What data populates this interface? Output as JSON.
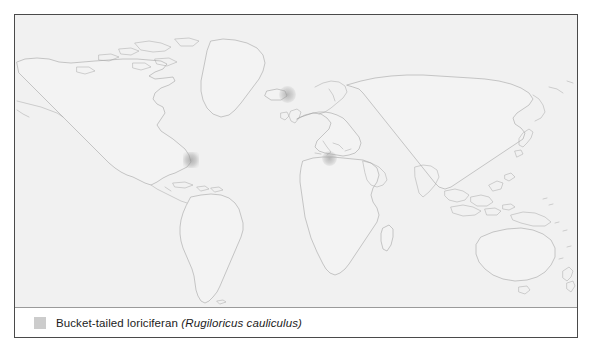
{
  "figure": {
    "type": "species-distribution-map",
    "projection": "equirectangular-world",
    "map_background_color": "#f1f1f1",
    "coastline_color": "#9e9e9e",
    "frame_color": "#4a4a4a",
    "page_background_color": "#ffffff"
  },
  "legend": {
    "swatch_color": "#cccccc",
    "common_name": "Bucket-tailed loriciferan",
    "scientific_name": "(Rugiloricus cauliculus)",
    "full_label": "Bucket-tailed loriciferan (Rugiloricus cauliculus)"
  },
  "occurrences": [
    {
      "name": "north-atlantic",
      "region_label": "North Atlantic / Norwegian Sea",
      "marker_color": "#9a9a9a",
      "shape": "soft-circle"
    },
    {
      "name": "us-east-coast",
      "region_label": "Northwest Atlantic / US East Coast",
      "marker_color": "#919191",
      "shape": "soft-square"
    },
    {
      "name": "mediterranean",
      "region_label": "Mediterranean Sea",
      "marker_color": "#949494",
      "shape": "soft-circle"
    }
  ]
}
